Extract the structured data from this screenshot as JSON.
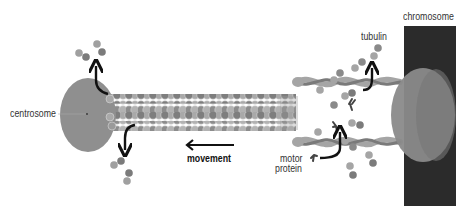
{
  "labels": {
    "centrosome": "centrosome",
    "movement": "movement",
    "motor_protein_line1": "motor",
    "motor_protein_line2": "protein",
    "tubulin": "tubulin",
    "chromosome": "chromosome"
  },
  "colors": {
    "centrosome": "#8f8f8f",
    "tubulin_dark": "#7a7a7a",
    "tubulin_light": "#a9a9a9",
    "chromosome_bar": "#2b2b2b",
    "kinetochore": "#8a8a8a",
    "arrow": "#111111",
    "fiber": "#9a9a9a"
  },
  "diagram": {
    "title_hint": "Kinetochore microtubule depolymerization with motor proteins pulling chromosome toward centrosome",
    "direction": "movement toward centrosome (leftward)"
  }
}
